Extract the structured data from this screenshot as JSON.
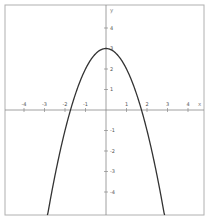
{
  "chart_data": {
    "type": "line",
    "title": "",
    "xlabel": "x",
    "ylabel": "y",
    "function": "y = 3 - x^2",
    "xlim": [
      -4.9,
      4.8
    ],
    "ylim": [
      -5.1,
      5.1
    ],
    "grid": false,
    "x_ticks": [
      -4,
      -3,
      -2,
      -1,
      1,
      2,
      3,
      4
    ],
    "y_ticks": [
      -4,
      -3,
      -2,
      -1,
      1,
      2,
      3,
      4
    ],
    "x_tick_labels": [
      "-4",
      "-3",
      "-2",
      "-1",
      "1",
      "2",
      "3",
      "4"
    ],
    "y_tick_labels": [
      "-4",
      "-3",
      "-2",
      "-1",
      "1",
      "2",
      "3",
      "4"
    ],
    "series": [
      {
        "name": "parabola",
        "x": [
          -2.85,
          -2.5,
          -2,
          -1.732,
          -1.5,
          -1,
          -0.5,
          0,
          0.5,
          1,
          1.5,
          1.732,
          2,
          2.5,
          2.85
        ],
        "y": [
          -5.12,
          -3.25,
          -1,
          0,
          0.75,
          2,
          2.75,
          3,
          2.75,
          2,
          0.75,
          0,
          -1,
          -3.25,
          -5.12
        ]
      }
    ],
    "vertex": [
      0,
      3
    ],
    "x_intercepts": [
      -1.732,
      1.732
    ]
  },
  "colors": {
    "frame": "#b0b0b0",
    "axis": "#888888",
    "curve": "#333333",
    "background": "#ffffff"
  },
  "layout": {
    "origin_px": [
      106,
      110
    ],
    "unit_px": 20.5,
    "frame": {
      "x": 5,
      "y": 5,
      "w": 199,
      "h": 210
    }
  }
}
